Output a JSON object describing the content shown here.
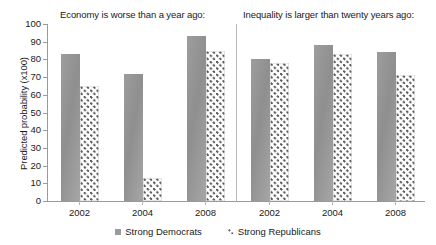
{
  "chart_data": {
    "type": "bar",
    "title": "",
    "xlabel": "",
    "ylabel": "Predicted probability (x100)",
    "ylim": [
      0,
      100
    ],
    "ytick_step": 10,
    "yticks": [
      100,
      90,
      80,
      70,
      60,
      50,
      40,
      30,
      20,
      10,
      0
    ],
    "grid": false,
    "legend_position": "bottom",
    "categories": [
      "2002",
      "2004",
      "2008"
    ],
    "panels": [
      {
        "title": "Economy is worse than a year ago:",
        "categories": [
          "2002",
          "2004",
          "2008"
        ],
        "series": [
          {
            "name": "Strong Democrats",
            "values": [
              83,
              72,
              93
            ]
          },
          {
            "name": "Strong Republicans",
            "values": [
              65,
              13,
              85
            ]
          }
        ]
      },
      {
        "title": "Inequality is larger than twenty years ago:",
        "categories": [
          "2002",
          "2004",
          "2008"
        ],
        "series": [
          {
            "name": "Strong Democrats",
            "values": [
              80,
              88,
              84
            ]
          },
          {
            "name": "Strong Republicans",
            "values": [
              78,
              83,
              71
            ]
          }
        ]
      }
    ],
    "legend": [
      {
        "label": "Strong Democrats",
        "swatch": "solid-gray",
        "color": "#9b9b9b"
      },
      {
        "label": "Strong Republicans",
        "swatch": "dotted",
        "color": "#5a5a5a"
      }
    ]
  }
}
